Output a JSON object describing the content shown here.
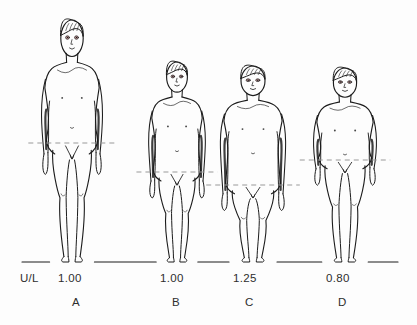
{
  "figure": {
    "caption_row_label": "U/L",
    "background_color": "#fdfdfd",
    "ink_color": "#1c1c1c",
    "reference_line_color": "#9a9a9a",
    "eye_tint": "#b05a5a",
    "ground_line_label": "ground-line",
    "subjects": [
      {
        "letter": "A",
        "ratio": "1.00",
        "build": "tall-slender-adolescent",
        "letter_x": 72,
        "ratio_x": 58,
        "segment_line_y": 143,
        "top_y": 20,
        "bottom_y": 262,
        "center_x": 72,
        "body_width": 56
      },
      {
        "letter": "B",
        "ratio": "1.00",
        "build": "short-slender-child",
        "letter_x": 172,
        "ratio_x": 160,
        "segment_line_y": 172,
        "top_y": 62,
        "bottom_y": 262,
        "center_x": 177,
        "body_width": 52
      },
      {
        "letter": "C",
        "ratio": "1.25",
        "build": "short-limbed-stocky-child",
        "letter_x": 245,
        "ratio_x": 233,
        "segment_line_y": 185,
        "top_y": 66,
        "bottom_y": 262,
        "center_x": 253,
        "body_width": 60
      },
      {
        "letter": "D",
        "ratio": "0.80",
        "build": "long-limbed-child",
        "letter_x": 338,
        "ratio_x": 326,
        "segment_line_y": 160,
        "top_y": 68,
        "bottom_y": 262,
        "center_x": 345,
        "body_width": 58
      }
    ]
  }
}
